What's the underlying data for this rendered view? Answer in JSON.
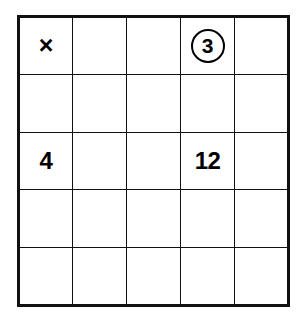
{
  "worksheet": {
    "type": "multiplication-grid",
    "rows": 5,
    "columns": 5,
    "background_color": "#ffffff",
    "line_color": "#111111",
    "text_color": "#000000"
  },
  "symbols": {
    "multiplication_sign": "×"
  },
  "cells": [
    [
      {
        "text": "×",
        "style": "operator"
      },
      {
        "text": "",
        "style": "empty"
      },
      {
        "text": "",
        "style": "empty"
      },
      {
        "text": "3",
        "style": "circled"
      },
      {
        "text": "",
        "style": "empty"
      }
    ],
    [
      {
        "text": "",
        "style": "empty"
      },
      {
        "text": "",
        "style": "empty"
      },
      {
        "text": "",
        "style": "empty"
      },
      {
        "text": "",
        "style": "empty"
      },
      {
        "text": "",
        "style": "empty"
      }
    ],
    [
      {
        "text": "4",
        "style": "plain"
      },
      {
        "text": "",
        "style": "empty"
      },
      {
        "text": "",
        "style": "empty"
      },
      {
        "text": "12",
        "style": "plain"
      },
      {
        "text": "",
        "style": "empty"
      }
    ],
    [
      {
        "text": "",
        "style": "empty"
      },
      {
        "text": "",
        "style": "empty"
      },
      {
        "text": "",
        "style": "empty"
      },
      {
        "text": "",
        "style": "empty"
      },
      {
        "text": "",
        "style": "empty"
      }
    ],
    [
      {
        "text": "",
        "style": "empty"
      },
      {
        "text": "",
        "style": "empty"
      },
      {
        "text": "",
        "style": "empty"
      },
      {
        "text": "",
        "style": "empty"
      },
      {
        "text": "",
        "style": "empty"
      }
    ]
  ]
}
